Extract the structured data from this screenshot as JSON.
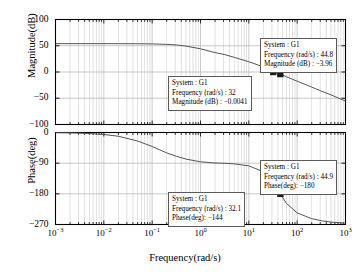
{
  "figure": {
    "xlabel": "Frequency(rad/s)",
    "subplots": [
      {
        "name": "magnitude",
        "ylabel": "Magnitude(dB)",
        "yticks": [
          "100",
          "50",
          "0",
          "-50",
          "-100"
        ]
      },
      {
        "name": "phase",
        "ylabel": "Phase(deg)",
        "yticks": [
          "0",
          "-90",
          "-180",
          "-270"
        ]
      }
    ],
    "xticks": [
      {
        "base": "10",
        "exp": "-3"
      },
      {
        "base": "10",
        "exp": "-2"
      },
      {
        "base": "10",
        "exp": "-1"
      },
      {
        "base": "10",
        "exp": "0"
      },
      {
        "base": "10",
        "exp": "1"
      },
      {
        "base": "10",
        "exp": "2"
      },
      {
        "base": "10",
        "exp": "3"
      }
    ],
    "tooltips": [
      {
        "id": "mag-tooltip-right",
        "line1": "System : G1",
        "line2": "Frequency (rad/s) : 44.8",
        "line3": "Magnitude (dB) : −3.96"
      },
      {
        "id": "mag-tooltip-left",
        "line1": "System : G1",
        "line2": "Frequency (rad/s) : 32",
        "line3": "Magnitude (dB) : −0.0041"
      },
      {
        "id": "phase-tooltip-right",
        "line1": "System : G1",
        "line2": "Frequency (rad/s) : 44.9",
        "line3": "Phase(deg): −180"
      },
      {
        "id": "phase-tooltip-left",
        "line1": "System : G1",
        "line2": "Frequency (rad/s) : 32.1",
        "line3": "Phase(deg): −144"
      }
    ]
  },
  "chart_data": [
    {
      "type": "line",
      "name": "magnitude",
      "title": "",
      "xlabel": "Frequency(rad/s)",
      "ylabel": "Magnitude(dB)",
      "xscale": "log",
      "xlim": [
        0.001,
        1000
      ],
      "ylim": [
        -100,
        100
      ],
      "yticks": [
        100,
        50,
        0,
        -50,
        -100
      ],
      "xticks": [
        0.001,
        0.01,
        0.1,
        1,
        10,
        100,
        1000
      ],
      "grid": true,
      "x": [
        0.001,
        0.002,
        0.005,
        0.01,
        0.02,
        0.05,
        0.1,
        0.2,
        0.32,
        0.5,
        1,
        2,
        3.2,
        5,
        10,
        20,
        32,
        44.8,
        60,
        100,
        200,
        320,
        500,
        1000
      ],
      "values": [
        54,
        54,
        54,
        54,
        53.9,
        53.8,
        53.5,
        52.6,
        51.5,
        49.3,
        44.2,
        37.0,
        33.0,
        27.9,
        19.5,
        9.8,
        0.0,
        -3.96,
        -9.0,
        -17.5,
        -28.8,
        -36.5,
        -43.5,
        -55.5
      ],
      "markers": [
        {
          "x": 32,
          "y": -0.0041,
          "label": "Frequency (rad/s) : 32, Magnitude (dB) : -0.0041"
        },
        {
          "x": 44.8,
          "y": -3.96,
          "label": "Frequency (rad/s) : 44.8, Magnitude (dB) : -3.96"
        }
      ]
    },
    {
      "type": "line",
      "name": "phase",
      "title": "",
      "xlabel": "Frequency(rad/s)",
      "ylabel": "Phase(deg)",
      "xscale": "log",
      "xlim": [
        0.001,
        1000
      ],
      "ylim": [
        -270,
        0
      ],
      "yticks": [
        0,
        -90,
        -180,
        -270
      ],
      "xticks": [
        0.001,
        0.01,
        0.1,
        1,
        10,
        100,
        1000
      ],
      "grid": true,
      "x": [
        0.001,
        0.002,
        0.005,
        0.01,
        0.02,
        0.05,
        0.1,
        0.2,
        0.32,
        0.5,
        1,
        2,
        3.2,
        5,
        10,
        20,
        32.1,
        44.9,
        60,
        100,
        200,
        320,
        500,
        1000
      ],
      "values": [
        -0.6,
        -1.2,
        -3.0,
        -5.8,
        -11.0,
        -25.0,
        -41.0,
        -60.0,
        -70.0,
        -78.0,
        -86.0,
        -89.5,
        -90.5,
        -92.0,
        -98.0,
        -115.0,
        -144.0,
        -180.0,
        -208.0,
        -236.0,
        -253.0,
        -259.0,
        -263.0,
        -266.0
      ],
      "markers": [
        {
          "x": 32.1,
          "y": -144,
          "label": "Frequency (rad/s) : 32.1, Phase(deg): -144"
        },
        {
          "x": 44.9,
          "y": -180,
          "label": "Frequency (rad/s) : 44.9, Phase(deg): -180"
        }
      ]
    }
  ],
  "style": {
    "curve_color": "#555555",
    "axis_color": "#000000",
    "grid_color": "#b9b9b9",
    "marker_color": "#1a1a1a",
    "tooltip_border": "#5a5a5a",
    "background": "#ffffff"
  }
}
